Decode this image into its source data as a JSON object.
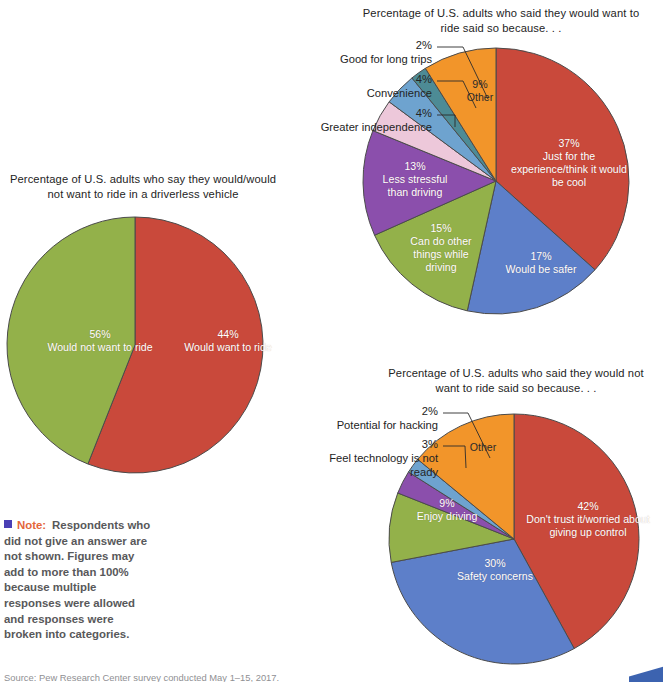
{
  "palette": {
    "red": "#c9493b",
    "green": "#93b14a",
    "blue": "#5d7fc9",
    "purple": "#8b4fac",
    "orange": "#f2952a",
    "teal": "#4d8b95",
    "pink": "#edc8da",
    "lightblue": "#6ea3cf",
    "outline": "#4b4b4b",
    "note_accent": "#e4663a",
    "note_bullet": "#4a3fb5"
  },
  "note": {
    "label": "Note:",
    "body": "Respondents who did not give an answer are not shown. Figures may add to more than 100% because multiple responses were allowed and responses were broken into categories."
  },
  "source": {
    "text": "Source: Pew Research Center survey conducted May 1–15, 2017."
  },
  "chart_data": [
    {
      "id": "driverless-willingness",
      "type": "pie",
      "title": "Percentage of U.S. adults who say they would/would not want to ride in a driverless vehicle",
      "start_angle": 0,
      "direction": "clockwise",
      "center": [
        135,
        345
      ],
      "radius": 128,
      "slices": [
        {
          "label": "Would not want to ride",
          "value": 56,
          "value_text": "56%",
          "color_key": "red",
          "label_pos": [
            12,
            328
          ],
          "label_width": 176,
          "label_style": "light"
        },
        {
          "label": "Would want to ride",
          "value": 44,
          "value_text": "44%",
          "color_key": "green",
          "label_pos": [
            148,
            328
          ],
          "label_width": 160,
          "label_style": "light"
        }
      ],
      "callouts": []
    },
    {
      "id": "would-ride-reasons",
      "type": "pie",
      "title": "Percentage of U.S. adults who said they would want to ride said so because. . .",
      "start_angle": 0,
      "direction": "clockwise",
      "center": [
        496,
        181
      ],
      "radius": 133,
      "slices": [
        {
          "label": "Just for the experience/think it would be cool",
          "value": 37,
          "value_text": "37%",
          "color_key": "red",
          "label_pos": [
            509,
            137
          ],
          "label_width": 120,
          "label_style": "light"
        },
        {
          "label": "Would be safer",
          "value": 17,
          "value_text": "17%",
          "color_key": "blue",
          "label_pos": [
            489,
            250
          ],
          "label_width": 104,
          "label_style": "light"
        },
        {
          "label": "Can do other things while driving",
          "value": 15,
          "value_text": "15%",
          "color_key": "green",
          "label_pos": [
            399,
            222
          ],
          "label_width": 84,
          "label_style": "light"
        },
        {
          "label": "Less stressful than driving",
          "value": 13,
          "value_text": "13%",
          "color_key": "purple",
          "label_pos": [
            371,
            160
          ],
          "label_width": 88,
          "label_style": "light"
        },
        {
          "label": "Greater independence",
          "value": 4,
          "value_text": "4%",
          "color_key": "pink",
          "label_style": "callout"
        },
        {
          "label": "Convenience",
          "value": 4,
          "value_text": "4%",
          "color_key": "lightblue",
          "label_style": "callout"
        },
        {
          "label": "Good for long trips",
          "value": 2,
          "value_text": "2%",
          "color_key": "teal",
          "label_style": "callout"
        },
        {
          "label": "Other",
          "value": 9,
          "value_text": "9%",
          "color_key": "orange",
          "label_pos": [
            446,
            78
          ],
          "label_width": 68,
          "label_style": "dark"
        }
      ],
      "callouts": [
        {
          "text": "2%\nGood for long trips",
          "pos": [
            304,
            38
          ],
          "width": 128,
          "align": "right",
          "line": [
            [
              437,
              47
            ],
            [
              463,
              47
            ],
            [
              488,
              99
            ]
          ]
        },
        {
          "text": "4%\nConvenience",
          "pos": [
            304,
            72
          ],
          "width": 128,
          "align": "right",
          "line": [
            [
              437,
              81
            ],
            [
              463,
              81
            ],
            [
              476,
              108
            ]
          ]
        },
        {
          "text": "4%\nGreater independence",
          "pos": [
            300,
            106
          ],
          "width": 132,
          "align": "right",
          "line": [
            [
              437,
              115
            ],
            [
              455,
              115
            ],
            [
              455,
              127
            ]
          ]
        }
      ]
    },
    {
      "id": "would-not-ride-reasons",
      "type": "pie",
      "title": "Percentage of U.S. adults who said they would not want to ride said so because. . .",
      "start_angle": 0,
      "direction": "clockwise",
      "center": [
        514,
        539
      ],
      "radius": 125,
      "slices": [
        {
          "label": "Don't trust it/worried about giving up control",
          "value": 42,
          "value_text": "42%",
          "color_key": "red",
          "label_pos": [
            526,
            500
          ],
          "label_width": 124,
          "label_style": "light"
        },
        {
          "label": "Safety concerns",
          "value": 30,
          "value_text": "30%",
          "color_key": "blue",
          "label_pos": [
            436,
            557
          ],
          "label_width": 118,
          "label_style": "light"
        },
        {
          "label": "Enjoy driving",
          "value": 9,
          "value_text": "9%",
          "color_key": "green",
          "label_pos": [
            400,
            497
          ],
          "label_width": 94,
          "label_style": "light"
        },
        {
          "label": "Feel technology is not ready",
          "value": 3,
          "value_text": "3%",
          "color_key": "purple",
          "label_style": "callout"
        },
        {
          "label": "Potential for hacking",
          "value": 2,
          "value_text": "2%",
          "color_key": "lightblue",
          "label_style": "callout"
        },
        {
          "label": "Other",
          "value": 14,
          "value_text": "",
          "color_key": "orange",
          "label_pos": [
            452,
            441
          ],
          "label_width": 62,
          "label_style": "dark"
        }
      ],
      "callouts": [
        {
          "text": "2%\nPotential for hacking",
          "pos": [
            308,
            404
          ],
          "width": 130,
          "align": "right",
          "line": [
            [
              443,
              413
            ],
            [
              468,
              413
            ],
            [
              490,
              458
            ]
          ]
        },
        {
          "text": "3%\nFeel technology is not ready",
          "pos": [
            306,
            437
          ],
          "width": 132,
          "align": "right",
          "line": [
            [
              443,
              446
            ],
            [
              465,
              446
            ],
            [
              466,
              468
            ]
          ]
        }
      ]
    }
  ]
}
